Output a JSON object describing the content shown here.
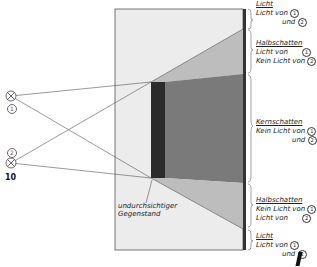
{
  "figure_number": "10",
  "sources": [
    {
      "id": "1",
      "name": "light-source-1"
    },
    {
      "id": "2",
      "name": "light-source-2"
    }
  ],
  "object_label_line1": "undurchsichtiger",
  "object_label_line2": "Gegenstand",
  "zones": [
    {
      "title": "Licht",
      "line1": "Licht von",
      "c1": "1",
      "line2": "und",
      "c2": "2"
    },
    {
      "title": "Halbschatten",
      "line1": "Licht von",
      "c1": "1",
      "line2": "Kein Licht von",
      "c2": "2"
    },
    {
      "title": "Kernschatten",
      "line1": "Kein Licht von",
      "c1": "1",
      "line2": "und",
      "c2": "2"
    },
    {
      "title": "Halbschatten",
      "line1": "Kein Licht von",
      "c1": "1",
      "line2": "Licht von",
      "c2": "2"
    },
    {
      "title": "Licht",
      "line1": "Licht von",
      "c1": "1",
      "line2": "und",
      "c2": "2"
    }
  ],
  "colors": {
    "screen_light": "#ececec",
    "penumbra": "#bdbdbd",
    "umbra": "#7a7a7a",
    "object": "#2b2b2b",
    "border": "#444444"
  }
}
